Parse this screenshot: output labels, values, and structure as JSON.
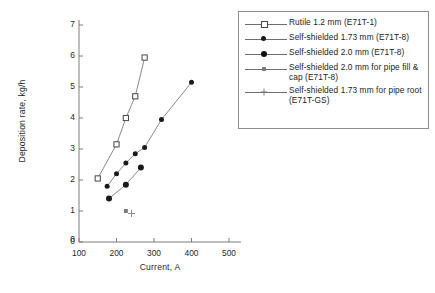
{
  "chart_data": {
    "type": "scatter",
    "title": "",
    "xlabel": "Current, A",
    "ylabel": "Deposition rate, kg/h",
    "xlim": [
      100,
      500
    ],
    "ylim": [
      0,
      7
    ],
    "xticks": [
      "100",
      "200",
      "300",
      "400",
      "500"
    ],
    "yticks": [
      "0",
      "1",
      "2",
      "3",
      "4",
      "5",
      "6",
      "7"
    ],
    "origin_label": "0",
    "grid": false,
    "legend_position": "top-right",
    "series": [
      {
        "name": "Rutile 1.2 mm (E71T-1)",
        "marker": "open-square",
        "x": [
          150,
          200,
          225,
          250,
          275
        ],
        "y": [
          2.05,
          3.15,
          4.0,
          4.7,
          5.95
        ]
      },
      {
        "name": "Self-shielded 1.73 mm (E71T-8)",
        "marker": "filled-circle",
        "x": [
          175,
          200,
          225,
          250,
          275,
          320,
          400
        ],
        "y": [
          1.8,
          2.2,
          2.55,
          2.85,
          3.05,
          3.95,
          5.15
        ]
      },
      {
        "name": "Self-shielded 2.0 mm (E71T-8)",
        "marker": "filled-circle-large",
        "x": [
          180,
          225,
          265
        ],
        "y": [
          1.4,
          1.85,
          2.4
        ]
      },
      {
        "name": "Self-shielded 2.0 mm for pipe fill & cap (E71T-8)",
        "marker": "small-square",
        "x": [
          225
        ],
        "y": [
          1.0
        ]
      },
      {
        "name": "Self-shielded 1.73 mm for pipe root (E71T-GS)",
        "marker": "cross",
        "x": [
          240
        ],
        "y": [
          0.92
        ]
      }
    ]
  },
  "legend": {
    "entries": [
      {
        "label": "Rutile 1.2 mm (E71T-1)",
        "marker": "open-square"
      },
      {
        "label": "Self-shielded 1.73 mm (E71T-8)",
        "marker": "filled-circle"
      },
      {
        "label": "Self-shielded 2.0 mm (E71T-8)",
        "marker": "filled-circle-large"
      },
      {
        "label": "Self-shielded 2.0 mm for pipe fill & cap (E71T-8)",
        "marker": "small-square"
      },
      {
        "label": "Self-shielded 1.73 mm for pipe root (E71T-GS)",
        "marker": "cross"
      }
    ]
  },
  "colors": {
    "axis": "#7d7d7d",
    "line": "#8a8a8a",
    "marker_fill": "#1a1a1a",
    "text": "#232323",
    "background": "#ffffff"
  }
}
